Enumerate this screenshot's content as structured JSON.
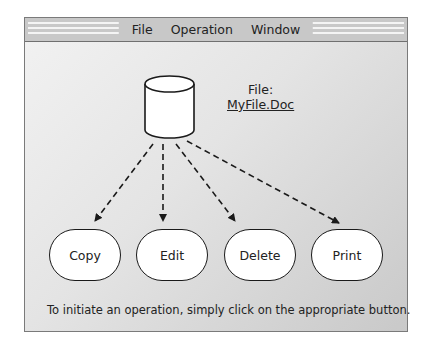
{
  "menu": {
    "items": [
      {
        "label": "File"
      },
      {
        "label": "Operation"
      },
      {
        "label": "Window"
      }
    ]
  },
  "file": {
    "caption": "File:",
    "name": "MyFile.Doc",
    "icon": "database-cylinder-icon"
  },
  "operations": [
    {
      "label": "Copy"
    },
    {
      "label": "Edit"
    },
    {
      "label": "Delete"
    },
    {
      "label": "Print"
    }
  ],
  "hint": "To initiate an operation, simply click on the appropriate button.",
  "colors": {
    "frame": "#7a7a7a",
    "titlebar": "#c8c8c8",
    "stroke": "#1a1a1a",
    "background_light": "#f2f2f2",
    "background_dark": "#c9c9c9"
  }
}
